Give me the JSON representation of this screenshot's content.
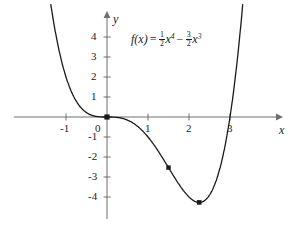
{
  "figure": {
    "kind": "function-graph",
    "background_color": "#ffffff",
    "curve_color": "#1a1a1a",
    "axis_color": "#6e6e6e",
    "text_color": "#1a1a1a"
  },
  "formula": {
    "lhs": "f(x)",
    "equals": "=",
    "term1_coef_num": "1",
    "term1_coef_den": "2",
    "term1_var": "x",
    "term1_exp": "4",
    "operator": "−",
    "term2_coef_num": "3",
    "term2_coef_den": "2",
    "term2_var": "x",
    "term2_exp": "3",
    "plain": "f(x) = 1/2 x^4 - 3/2 x^3"
  },
  "axes": {
    "x_name": "x",
    "y_name": "y",
    "x_ticks": [
      "-1",
      "0",
      "1",
      "2",
      "3"
    ],
    "y_ticks": [
      "4",
      "3",
      "2",
      "1",
      "-1",
      "-2",
      "-3",
      "-4"
    ]
  },
  "chart_data": {
    "type": "line",
    "title": "",
    "xlabel": "x",
    "ylabel": "y",
    "function": "f(x) = 0.5*x^4 - 1.5*x^3",
    "xlim": [
      -1.6,
      3.6
    ],
    "ylim": [
      -5.0,
      5.2
    ],
    "grid": false,
    "legend_position": "none",
    "x_ticks": [
      -1,
      0,
      1,
      2,
      3
    ],
    "y_ticks": [
      4,
      3,
      2,
      1,
      -1,
      -2,
      -3,
      -4
    ],
    "annotations": [
      "f(x) = 1/2 x^4 - 3/2 x^3"
    ],
    "marked_points": [
      {
        "x": 0,
        "y": 0,
        "label": ""
      },
      {
        "x": 1.5,
        "y": -2.53,
        "label": ""
      },
      {
        "x": 2.25,
        "y": -4.27,
        "label": ""
      }
    ],
    "roots": [
      0,
      3
    ],
    "minimum": {
      "x": 2.25,
      "y": -4.27
    },
    "inflection_points": [
      {
        "x": 0,
        "y": 0
      },
      {
        "x": 1.5,
        "y": -2.53
      }
    ],
    "series": [
      {
        "name": "f(x) = 1/2 x^4 - 3/2 x^3",
        "x": [
          -1.45,
          -1.35,
          -1.25,
          -1.15,
          -1.05,
          -0.95,
          -0.85,
          -0.75,
          -0.65,
          -0.55,
          -0.45,
          -0.35,
          -0.25,
          -0.15,
          -0.05,
          0.0,
          0.25,
          0.5,
          0.75,
          1.0,
          1.25,
          1.5,
          1.75,
          2.0,
          2.25,
          2.5,
          2.75,
          3.0,
          3.2,
          3.35,
          3.45
        ],
        "y": [
          6.78,
          5.35,
          4.15,
          3.16,
          2.34,
          1.69,
          1.18,
          0.79,
          0.5,
          0.3,
          0.16,
          0.08,
          0.03,
          0.01,
          0.0,
          0.0,
          -0.02,
          -0.16,
          -0.47,
          -1.0,
          -1.71,
          -2.53,
          -3.34,
          -4.0,
          -4.27,
          -3.91,
          -2.64,
          0.0,
          2.36,
          6.6,
          9.86
        ],
        "color": "#1a1a1a"
      }
    ]
  }
}
